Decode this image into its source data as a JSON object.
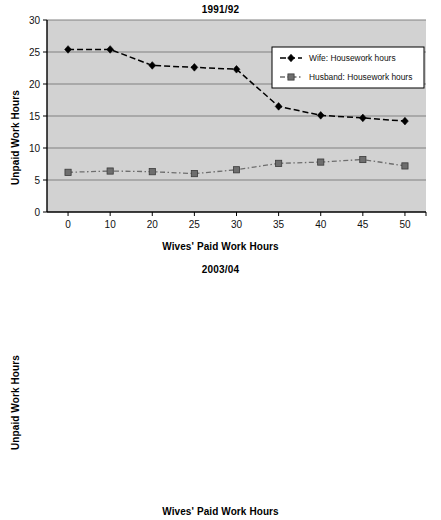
{
  "figure": {
    "ylabel": "Unpaid Work Hours",
    "xlabel": "Wives' Paid Work Hours",
    "plot_bg": "#d2d2d2",
    "gridline_color": "#808080",
    "axis_color": "#000000",
    "wife_color": "#000000",
    "husband_color": "#6e6e6e"
  },
  "chart_data": [
    {
      "type": "line",
      "title": "1991/92",
      "xlabel": "Wives' Paid Work Hours",
      "ylabel": "Unpaid Work Hours",
      "categories": [
        "0",
        "10",
        "20",
        "25",
        "30",
        "35",
        "40",
        "45",
        "50"
      ],
      "ylim": [
        0,
        30
      ],
      "yticks": [
        "0",
        "5",
        "10",
        "15",
        "20",
        "25",
        "30"
      ],
      "grid": true,
      "legend_position": "upper-right-inside",
      "series": [
        {
          "name": "Wife: Housework hours",
          "marker": "diamond",
          "linestyle": "dashed",
          "values": [
            25.4,
            25.4,
            22.9,
            22.6,
            22.3,
            16.5,
            15.1,
            14.7,
            14.2
          ]
        },
        {
          "name": "Husband: Housework hours",
          "marker": "square",
          "linestyle": "dashdot",
          "values": [
            6.2,
            6.4,
            6.3,
            6.0,
            6.6,
            7.6,
            7.8,
            8.2,
            7.2
          ]
        }
      ]
    },
    {
      "type": "line",
      "title": "2003/04",
      "xlabel": "Wives' Paid Work Hours",
      "ylabel": "Unpaid Work Hours",
      "categories": [
        "0",
        "10",
        "20",
        "25",
        "30",
        "35",
        "40",
        "45",
        "50"
      ],
      "ylim": [
        0,
        30
      ],
      "yticks": [
        "0",
        "5",
        "10",
        "15",
        "20",
        "25",
        "30"
      ],
      "grid": true,
      "legend_position": "upper-right-inside",
      "series": [
        {
          "name": "Wife: Housework hours",
          "marker": "diamond",
          "linestyle": "solid",
          "values": [
            21.9,
            20.1,
            20.2,
            17.9,
            16.5,
            15.0,
            12.7,
            11.7,
            11.8
          ]
        },
        {
          "name": "Husband: Housework hours",
          "marker": "square",
          "linestyle": "solid",
          "values": [
            6.5,
            6.6,
            6.5,
            7.0,
            6.9,
            7.7,
            7.4,
            7.6,
            8.6
          ]
        }
      ]
    }
  ]
}
